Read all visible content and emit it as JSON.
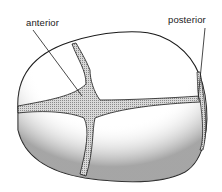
{
  "diagram": {
    "labels": {
      "anterior": "anterior",
      "posterior": "posterior"
    },
    "colors": {
      "outline": "#1a1a1a",
      "shading": "#555555",
      "fontanelle_fill": "#bdbdbd",
      "background": "#ffffff"
    }
  }
}
